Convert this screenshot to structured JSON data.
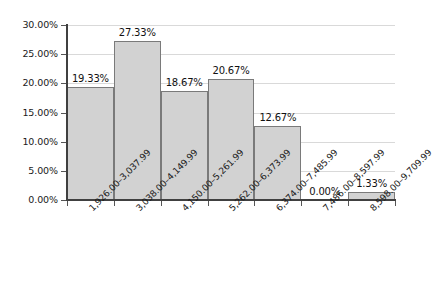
{
  "chart_data": {
    "type": "bar",
    "title": "",
    "subtitle": "",
    "xlabel": "",
    "ylabel": "",
    "categories": [
      "1,926.00–3,037.99",
      "3,038.00–4,149.99",
      "4,150.00–5,261.99",
      "5,262.00–6,373.99",
      "6,374.00–7,485.99",
      "7,486.00–8,597.99",
      "8,598.00–9,709.99"
    ],
    "values": [
      19.33,
      27.33,
      18.67,
      20.67,
      12.67,
      0.0,
      1.33
    ],
    "value_labels": [
      "19.33%",
      "27.33%",
      "18.67%",
      "20.67%",
      "12.67%",
      "0.00%",
      "1.33%"
    ],
    "ylim": [
      0,
      30
    ],
    "ytick_values": [
      0,
      5,
      10,
      15,
      20,
      25,
      30
    ],
    "ytick_labels": [
      "0.00%",
      "5.00%",
      "10.00%",
      "15.00%",
      "20.00%",
      "25.00%",
      "30.00%"
    ],
    "grid": true,
    "legend": false,
    "legend_position": "none",
    "bar_fill_color": "#d2d2d2",
    "bar_border_color": "#7a7a7a",
    "gridline_color": "#d9d9d9",
    "axis_color": "#404040",
    "background_color": "#ffffff",
    "text_color": "#1a1a1a"
  }
}
